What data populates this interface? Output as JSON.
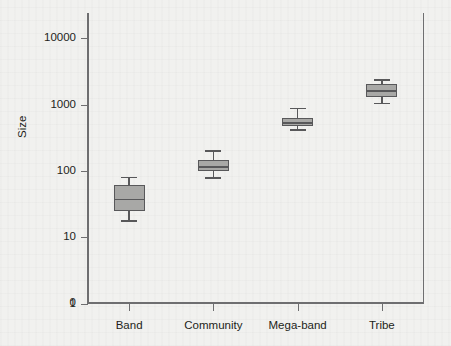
{
  "figure": {
    "ylabel": "Size",
    "y_ticks": [
      {
        "label": "10000",
        "value": 10000
      },
      {
        "label": "1000",
        "value": 1000
      },
      {
        "label": "100",
        "value": 100
      },
      {
        "label": "10",
        "value": 10
      },
      {
        "label": "1",
        "value": 1
      },
      {
        "label": "0",
        "value": 0
      }
    ],
    "x_ticks": [
      "Band",
      "Community",
      "Mega-band",
      "Tribe"
    ],
    "colors": {
      "box_fill": "#a8a8a6",
      "box_edge": "#58585a",
      "axis": "#6e6e70",
      "text": "#231f20",
      "background": "#f1f1ef"
    }
  },
  "chart_data": {
    "type": "box",
    "title": "",
    "xlabel": "",
    "ylabel": "Size",
    "yscale": "log",
    "ylim": [
      1,
      20000
    ],
    "ytick_labels": [
      "0",
      "1",
      "10",
      "100",
      "1000",
      "10000"
    ],
    "grid": false,
    "legend": "none",
    "categories": [
      "Band",
      "Community",
      "Mega-band",
      "Tribe"
    ],
    "boxes": [
      {
        "category": "Band",
        "whisker_low": 18,
        "q1": 25,
        "median": 38,
        "q3": 62,
        "whisker_high": 82
      },
      {
        "category": "Community",
        "whisker_low": 80,
        "q1": 100,
        "median": 118,
        "q3": 145,
        "whisker_high": 205
      },
      {
        "category": "Mega-band",
        "whisker_low": 430,
        "q1": 470,
        "median": 545,
        "q3": 620,
        "whisker_high": 900
      },
      {
        "category": "Tribe",
        "whisker_low": 1070,
        "q1": 1320,
        "median": 1650,
        "q3": 2050,
        "whisker_high": 2400
      }
    ]
  }
}
